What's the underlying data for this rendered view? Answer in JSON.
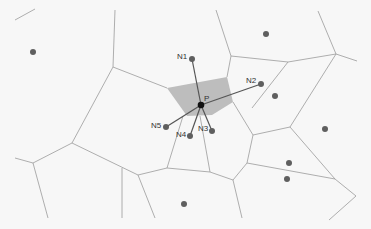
{
  "diagram": {
    "colors": {
      "background": "#f7f7f7",
      "edge": "#9a9a9a",
      "cell_fill": "#bdbdbd",
      "site": "#5f5f5f",
      "center": "#111111",
      "spoke": "#555555"
    },
    "center": {
      "label": "P",
      "x": 201,
      "y": 105
    },
    "neighbors": [
      {
        "label": "N1",
        "x": 192,
        "y": 59,
        "lx": 177,
        "ly": 59
      },
      {
        "label": "N2",
        "x": 261,
        "y": 84,
        "lx": 246,
        "ly": 83
      },
      {
        "label": "N3",
        "x": 212,
        "y": 131,
        "lx": 198,
        "ly": 131
      },
      {
        "label": "N4",
        "x": 190,
        "y": 136,
        "lx": 176,
        "ly": 137
      },
      {
        "label": "N5",
        "x": 166,
        "y": 127,
        "lx": 151,
        "ly": 128
      }
    ],
    "other_sites": [
      {
        "x": 33,
        "y": 52
      },
      {
        "x": 266,
        "y": 34
      },
      {
        "x": 275,
        "y": 96
      },
      {
        "x": 325,
        "y": 129
      },
      {
        "x": 289,
        "y": 163
      },
      {
        "x": 287,
        "y": 179
      },
      {
        "x": 184,
        "y": 204
      }
    ],
    "highlighted_cell": "167,88 227,77 233,102 212,115 187,116",
    "edges": [
      [
        15,
        20,
        35,
        9
      ],
      [
        115,
        10,
        113,
        67
      ],
      [
        113,
        67,
        167,
        88
      ],
      [
        113,
        67,
        72,
        143
      ],
      [
        72,
        143,
        33,
        163
      ],
      [
        33,
        163,
        15,
        158
      ],
      [
        33,
        163,
        48,
        218
      ],
      [
        72,
        143,
        138,
        175
      ],
      [
        122,
        168,
        122,
        218
      ],
      [
        138,
        175,
        155,
        218
      ],
      [
        138,
        175,
        167,
        168
      ],
      [
        167,
        168,
        183,
        116
      ],
      [
        167,
        168,
        210,
        172
      ],
      [
        200,
        116,
        210,
        172
      ],
      [
        210,
        172,
        233,
        180
      ],
      [
        233,
        180,
        242,
        218
      ],
      [
        233,
        180,
        247,
        163
      ],
      [
        247,
        163,
        253,
        135
      ],
      [
        233,
        102,
        253,
        135
      ],
      [
        253,
        135,
        290,
        127
      ],
      [
        290,
        127,
        307,
        100
      ],
      [
        307,
        100,
        336,
        54
      ],
      [
        290,
        127,
        335,
        179
      ],
      [
        247,
        163,
        335,
        179
      ],
      [
        335,
        179,
        356,
        196
      ],
      [
        356,
        196,
        329,
        220
      ],
      [
        216,
        10,
        231,
        56
      ],
      [
        231,
        56,
        227,
        77
      ],
      [
        231,
        56,
        288,
        62
      ],
      [
        288,
        62,
        336,
        54
      ],
      [
        288,
        62,
        252,
        108
      ],
      [
        318,
        11,
        336,
        54
      ],
      [
        336,
        54,
        357,
        61
      ]
    ]
  }
}
